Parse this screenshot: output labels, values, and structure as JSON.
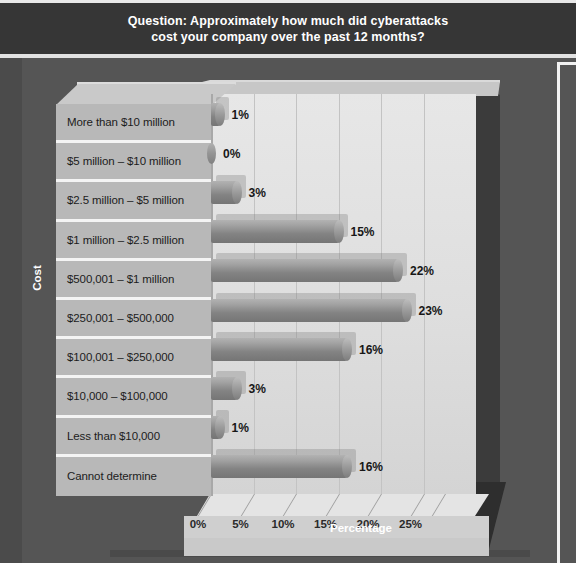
{
  "title": {
    "text": "Question: Approximately how much did cyberattacks\ncost your company over the past 12 months?"
  },
  "axes": {
    "y_title": "Cost",
    "x_title": "Percentage",
    "x_ticks": [
      "0%",
      "5%",
      "10%",
      "15%",
      "20%",
      "25%"
    ]
  },
  "colors": {
    "background": "#545454",
    "title_band": "#363636",
    "panel": "#b8b8b8",
    "plot": "#e0e0e0",
    "bar": "#8a8a8a",
    "text": "#1c1c1c",
    "white_rule": "#f2f2f2"
  },
  "chart_data": {
    "type": "bar",
    "orientation": "horizontal",
    "title": "Question: Approximately how much did cyberattacks cost your company over the past 12 months?",
    "xlabel": "Percentage",
    "ylabel": "Cost",
    "xlim": [
      0,
      27
    ],
    "xticks": [
      0,
      5,
      10,
      15,
      20,
      25
    ],
    "grid": true,
    "legend": "none",
    "categories": [
      "More than $10 million",
      "$5 million – $10 million",
      "$2.5 million – $5 million",
      "$1 million – $2.5 million",
      "$500,001 – $1 million",
      "$250,001 – $500,000",
      "$100,001 – $250,000",
      "$10,000 – $100,000",
      "Less than $10,000",
      "Cannot determine"
    ],
    "values": [
      1,
      0,
      3,
      15,
      22,
      23,
      16,
      3,
      1,
      16
    ],
    "value_labels": [
      "1%",
      "0%",
      "3%",
      "15%",
      "22%",
      "23%",
      "16%",
      "3%",
      "1%",
      "16%"
    ]
  }
}
